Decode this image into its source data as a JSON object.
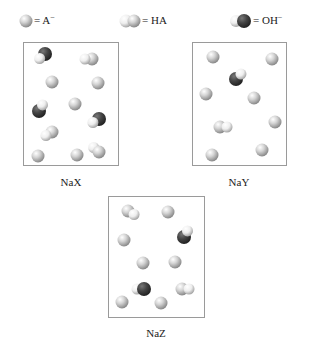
{
  "legend": {
    "items": [
      {
        "species": "A-",
        "label": "= A",
        "sup": "−",
        "icon": "a-minus-sphere-icon"
      },
      {
        "species": "HA",
        "label": "= HA",
        "sup": "",
        "icon": "ha-molecule-icon"
      },
      {
        "species": "OH-",
        "label": "= OH",
        "sup": "−",
        "icon": "oh-minus-molecule-icon"
      }
    ]
  },
  "colors": {
    "a_light": "#f4f4f4",
    "a_mid": "#c9c9c9",
    "a_dark": "#8c8c8c",
    "oh_dark": "#2f2f2f",
    "oh_mid": "#4d4d4d",
    "border": "#9a9a9a"
  },
  "panels": [
    {
      "name": "NaX",
      "label": "NaX",
      "counts": {
        "A-": 6,
        "HA": 3,
        "OH-": 3
      }
    },
    {
      "name": "NaY",
      "label": "NaY",
      "counts": {
        "A-": 8,
        "HA": 1,
        "OH-": 1
      }
    },
    {
      "name": "NaZ",
      "label": "NaZ",
      "counts": {
        "A-": 7,
        "HA": 2,
        "OH-": 2
      }
    }
  ]
}
